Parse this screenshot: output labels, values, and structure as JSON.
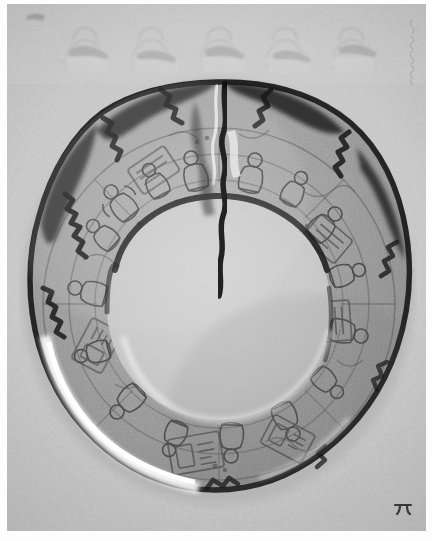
{
  "image": {
    "kind": "photograph",
    "medium": "black-and-white archival photographic print",
    "subject": "carved stone ring-shaped disc (annular plaque) with incised figural glyph scenes",
    "orientation": "portrait",
    "background_tone": "#c9c9c9",
    "print_border_color": "#fdfdfd"
  },
  "object": {
    "name": "annular carved disc",
    "outer_edge": "irregular chipped dark rim",
    "center": "smooth undecorated circular field",
    "center_tone": "#c8c8c8",
    "ring_tone": "#9a9a9a",
    "rim_tone": "#2a2a2a",
    "damage": "vertical fracture splitting the ring at the top",
    "highlight": "bright crescent of light along the lower-left edge",
    "decoration": "dense low-relief incised seated figures, panels and glyph blocks covering the entire ring"
  },
  "features": {
    "top_band_label": "faint cropped relief motif band at the top of the frame",
    "crack_label": "vertical break in the ring",
    "inner_field_label": "blank central disc",
    "highlight_label": "specular crescent highlight",
    "rim_label": "chipped outer rim"
  },
  "annotations": {
    "upper_right_note": "",
    "upper_right_note_description": "faint illegible vertical handwritten inscription in the margin",
    "lower_right_mark": "π",
    "lower_right_mark_description": "small dark hand-inked mark in the lower right corner"
  },
  "palette": {
    "paper": "#fdfdfd",
    "background": "#c9c9c9",
    "midtone": "#9a9a9a",
    "shadow": "#2a2a2a",
    "highlight": "#f2f2f2"
  }
}
